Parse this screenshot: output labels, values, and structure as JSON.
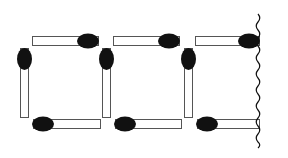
{
  "diagram": {
    "colors": {
      "stick_fill": "#ffffff",
      "stick_outline": "#555555",
      "head": "#111111",
      "wave": "#111111"
    },
    "matches": [
      {
        "id": "top-1",
        "orientation": "horizontal",
        "x": 32,
        "y": 36,
        "length": 66,
        "head": "right"
      },
      {
        "id": "top-2",
        "orientation": "horizontal",
        "x": 113,
        "y": 36,
        "length": 66,
        "head": "right"
      },
      {
        "id": "top-3",
        "orientation": "horizontal",
        "x": 195,
        "y": 36,
        "length": 64,
        "head": "right"
      },
      {
        "id": "left-1",
        "orientation": "vertical",
        "x": 20,
        "y": 48,
        "length": 69,
        "head": "top"
      },
      {
        "id": "left-2",
        "orientation": "vertical",
        "x": 102,
        "y": 48,
        "length": 69,
        "head": "top"
      },
      {
        "id": "left-3",
        "orientation": "vertical",
        "x": 184,
        "y": 48,
        "length": 69,
        "head": "top"
      },
      {
        "id": "bottom-1",
        "orientation": "horizontal",
        "x": 33,
        "y": 119,
        "length": 67,
        "head": "left"
      },
      {
        "id": "bottom-2",
        "orientation": "horizontal",
        "x": 115,
        "y": 119,
        "length": 66,
        "head": "left"
      },
      {
        "id": "bottom-3",
        "orientation": "horizontal",
        "x": 197,
        "y": 119,
        "length": 62,
        "head": "left"
      }
    ],
    "boundary": {
      "type": "wavy-line",
      "x": 258,
      "y_start": 14,
      "y_end": 148
    }
  }
}
